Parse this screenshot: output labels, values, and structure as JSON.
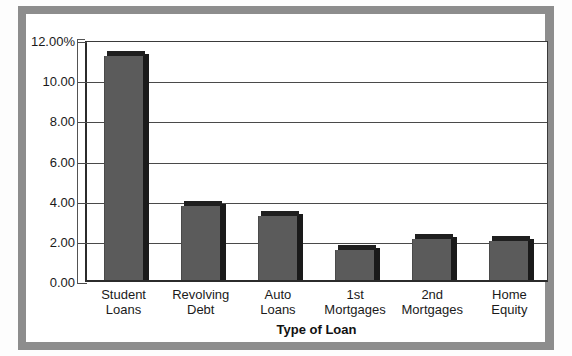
{
  "figure": {
    "frame_color": "#8d8d8d",
    "background_color": "#ffffff",
    "cropped_title_fragment": ""
  },
  "chart_data": {
    "type": "bar",
    "title": "",
    "subtitle": "",
    "xlabel": "Type of Loan",
    "ylabel": "",
    "categories": [
      "Student\nLoans",
      "Revolving\nDebt",
      "Auto\nLoans",
      "1st\nMortgages",
      "2nd\nMortgages",
      "Home\nEquity"
    ],
    "category_lines": [
      [
        "Student",
        "Loans"
      ],
      [
        "Revolving",
        "Debt"
      ],
      [
        "Auto",
        "Loans"
      ],
      [
        "1st",
        "Mortgages"
      ],
      [
        "2nd",
        "Mortgages"
      ],
      [
        "Home",
        "Equity"
      ]
    ],
    "values": [
      11.15,
      3.7,
      3.2,
      1.5,
      2.05,
      1.95
    ],
    "ylim": [
      0,
      12
    ],
    "ytick_values": [
      12,
      10,
      8,
      6,
      4,
      2,
      0
    ],
    "ytick_labels": [
      "12.00%",
      "10.00",
      "8.00",
      "6.00",
      "4.00",
      "2.00",
      "0.00"
    ],
    "grid": true,
    "grid_axis": "y",
    "legend": false,
    "legend_position": "none",
    "bar_style": "3d",
    "bar_fill_color": "#5b5b5b",
    "bar_shade_color": "#1a1a1a",
    "axis_color": "#2b2b2b",
    "gridline_color": "#4a4a4a"
  },
  "axis_title": {
    "x": "Type of Loan"
  }
}
